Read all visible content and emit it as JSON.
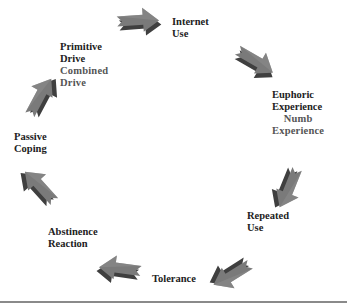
{
  "diagram": {
    "type": "cycle",
    "direction": "clockwise",
    "arrow_color": "#6e6e6e",
    "arrow_shadow_color": "#3f3f3f",
    "stages": [
      {
        "id": "internet-use",
        "lines": [
          "Internet",
          "Use"
        ],
        "secondary": []
      },
      {
        "id": "euphoric-experience",
        "lines": [
          "Euphoric",
          "Experience"
        ],
        "secondary": [
          "Numb",
          "Experience"
        ]
      },
      {
        "id": "repeated-use",
        "lines": [
          "Repeated",
          "Use"
        ],
        "secondary": []
      },
      {
        "id": "tolerance",
        "lines": [
          "Tolerance"
        ],
        "secondary": []
      },
      {
        "id": "abstinence-reaction",
        "lines": [
          "Abstinence",
          "Reaction"
        ],
        "secondary": []
      },
      {
        "id": "passive-coping",
        "lines": [
          "Passive",
          "Coping"
        ],
        "secondary": []
      },
      {
        "id": "primitive-drive",
        "lines": [
          "Primitive",
          "Drive"
        ],
        "secondary": [
          "Combined",
          "Drive"
        ]
      }
    ],
    "flow": [
      "Primitive Drive → Internet Use",
      "Internet Use → Euphoric Experience",
      "Euphoric Experience → Repeated Use",
      "Repeated Use → Tolerance",
      "Tolerance → Abstinence Reaction",
      "Abstinence Reaction → Passive Coping",
      "Passive Coping → Primitive Drive"
    ]
  }
}
